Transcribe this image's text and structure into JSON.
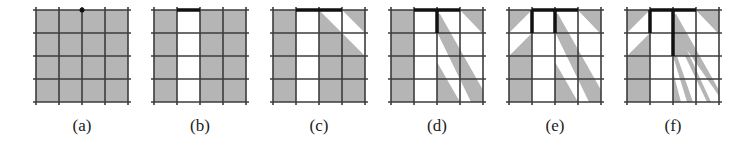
{
  "figure": {
    "grid_size": 4,
    "colors": {
      "shaded": "#b5b5b5",
      "empty": "#ffffff",
      "grid_line": "#3c3c3c",
      "wall": "#111111"
    },
    "panels": [
      {
        "id": "a",
        "label": "(a)",
        "origin_x": 36
      },
      {
        "id": "b",
        "label": "(b)",
        "origin_x": 154
      },
      {
        "id": "c",
        "label": "(c)",
        "origin_x": 273
      },
      {
        "id": "d",
        "label": "(d)",
        "origin_x": 391
      },
      {
        "id": "e",
        "label": "(e)",
        "origin_x": 509
      },
      {
        "id": "f",
        "label": "(f)",
        "origin_x": 627
      }
    ]
  }
}
